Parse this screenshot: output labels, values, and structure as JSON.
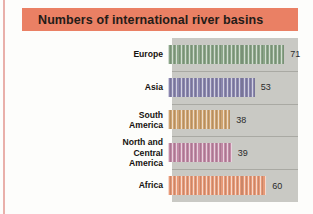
{
  "figure": {
    "title": "Numbers of international river basins",
    "title_bg": "#ea8064",
    "plot_bg": "#c9c9c4",
    "page_bg": "#fdfdfb"
  },
  "chart_data": {
    "type": "bar",
    "orientation": "horizontal",
    "title": "Numbers of international river basins",
    "xlabel": "",
    "ylabel": "",
    "categories": [
      "Europe",
      "Asia",
      "South America",
      "North and Central America",
      "Africa"
    ],
    "values": [
      71,
      53,
      38,
      39,
      60
    ],
    "value_labels": [
      "71",
      "53",
      "38",
      "39",
      "60"
    ],
    "colors": [
      "#8ba588",
      "#8a86ae",
      "#cfa471",
      "#c28aa6",
      "#e79a78"
    ],
    "xlim": [
      0,
      77
    ],
    "grid": false,
    "legend": null,
    "bars": [
      {
        "category": "Europe",
        "label_lines": [
          "Europe"
        ],
        "value": 71,
        "value_label": "71",
        "color": "#8ba588"
      },
      {
        "category": "Asia",
        "label_lines": [
          "Asia"
        ],
        "value": 53,
        "value_label": "53",
        "color": "#8a86ae"
      },
      {
        "category": "South America",
        "label_lines": [
          "South",
          "America"
        ],
        "value": 38,
        "value_label": "38",
        "color": "#cfa471"
      },
      {
        "category": "North and Central America",
        "label_lines": [
          "North and",
          "Central",
          "America"
        ],
        "value": 39,
        "value_label": "39",
        "color": "#c28aa6"
      },
      {
        "category": "Africa",
        "label_lines": [
          "Africa"
        ],
        "value": 60,
        "value_label": "60",
        "color": "#e79a78"
      }
    ]
  }
}
